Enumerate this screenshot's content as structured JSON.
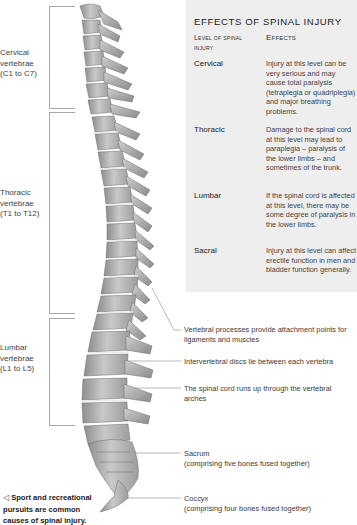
{
  "diagram": {
    "type": "anatomical-illustration"
  },
  "regions": [
    {
      "id": "cervical",
      "label": "Cervical vertebrae (C1 to C7)",
      "lines": [
        "Cervical",
        "vertebrae",
        "(C1 to C7)"
      ]
    },
    {
      "id": "thoracic",
      "label": "Thoracic vertebrae (T1 to T12)",
      "lines": [
        "Thoracic",
        "vertebrae",
        "(T1 to T12)"
      ]
    },
    {
      "id": "lumbar",
      "label": "Lumbar vertebrae (L1 to L5)",
      "lines": [
        "Lumbar",
        "vertebrae",
        "(L1 to L5)"
      ]
    }
  ],
  "panel": {
    "title": "EFFECTS OF SPINAL INJURY",
    "col_level": "Level of spinal injury",
    "col_effects": "Effects",
    "rows": [
      {
        "level": "Cervical",
        "effect": "Injury at this level can be very serious and may cause total paralysis (tetraplegia or quadriplegia) and major breathing problems."
      },
      {
        "level": "Thoracic",
        "effect": "Damage to the spinal cord at this level may lead to paraplegia – paralysis of the lower limbs – and sometimes of the trunk."
      },
      {
        "level": "Lumbar",
        "effect": "If the spinal cord is affected at this level, there may be some degree of paralysis in the lower limbs."
      },
      {
        "level": "Sacral",
        "effect": "Injury at this level can affect erectile function in men and bladder function generally."
      }
    ]
  },
  "annotations": [
    {
      "id": "processes",
      "text": "Vertebral processes provide attachment points for ligaments and muscles"
    },
    {
      "id": "discs",
      "text": "Intervertebral discs lie between each vertebra"
    },
    {
      "id": "cord",
      "text": "The spinal cord runs up through the vertebral arches"
    },
    {
      "id": "sacrum",
      "title": "Sacrum",
      "text": "(comprising five bones fused together)"
    },
    {
      "id": "coccyx",
      "title": "Coccyx",
      "text": "(comprising four bones fused together)"
    }
  ],
  "caption": {
    "marker": "◁",
    "text": "Sport and recreational pursuits are common causes of spinal injury."
  },
  "colors": {
    "panel_bg": "#eeeeee",
    "bone_light": "#d4d4d4",
    "bone_mid": "#a9a9a9",
    "bone_dark": "#7a7a7a",
    "leader_line": "#9a9a9a"
  }
}
